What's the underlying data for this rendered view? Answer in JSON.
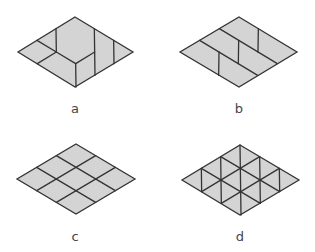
{
  "style": {
    "fill": "#d4d4d4",
    "stroke": "#333333",
    "background": "#ffffff"
  },
  "figures": [
    {
      "id": "a",
      "label": "a",
      "label_pos": [
        75,
        102
      ],
      "top": [
        75,
        17
      ],
      "right": [
        133,
        52
      ],
      "bottom": [
        75,
        87
      ],
      "left": [
        18,
        52
      ],
      "divisions": 3,
      "segments": [
        [
          [
            0,
            1
          ],
          [
            1,
            2
          ]
        ],
        [
          [
            0,
            2
          ],
          [
            1,
            2
          ]
        ],
        [
          [
            1,
            2
          ],
          [
            2,
            2
          ]
        ],
        [
          [
            1,
            2
          ],
          [
            1,
            3
          ]
        ],
        [
          [
            2,
            2
          ],
          [
            3,
            3
          ]
        ],
        [
          [
            2,
            2
          ],
          [
            2,
            1
          ]
        ],
        [
          [
            1,
            0
          ],
          [
            3,
            2
          ]
        ],
        [
          [
            2,
            0
          ],
          [
            3,
            1
          ]
        ]
      ]
    },
    {
      "id": "b",
      "label": "b",
      "label_pos": [
        239,
        102
      ],
      "top": [
        239,
        17
      ],
      "right": [
        297,
        52
      ],
      "bottom": [
        239,
        87
      ],
      "left": [
        180,
        52
      ],
      "divisions": 3,
      "segments": [
        [
          [
            0,
            1
          ],
          [
            3,
            1
          ]
        ],
        [
          [
            0,
            2
          ],
          [
            3,
            2
          ]
        ],
        [
          [
            1,
            0
          ],
          [
            2,
            1
          ]
        ],
        [
          [
            1,
            1
          ],
          [
            2,
            2
          ]
        ],
        [
          [
            1,
            2
          ],
          [
            2,
            3
          ]
        ]
      ]
    },
    {
      "id": "c",
      "label": "c",
      "label_pos": [
        75,
        230
      ],
      "top": [
        76,
        144
      ],
      "right": [
        135,
        179
      ],
      "bottom": [
        76,
        214
      ],
      "left": [
        17,
        179
      ],
      "divisions": 3,
      "segments": [
        [
          [
            0,
            1
          ],
          [
            3,
            1
          ]
        ],
        [
          [
            0,
            2
          ],
          [
            3,
            2
          ]
        ],
        [
          [
            1,
            0
          ],
          [
            1,
            3
          ]
        ],
        [
          [
            2,
            0
          ],
          [
            2,
            3
          ]
        ]
      ]
    },
    {
      "id": "d",
      "label": "d",
      "label_pos": [
        240,
        230
      ],
      "top": [
        240,
        145
      ],
      "right": [
        299,
        180
      ],
      "bottom": [
        240,
        215
      ],
      "left": [
        182,
        180
      ],
      "divisions": 3,
      "segments": [
        [
          [
            0,
            1
          ],
          [
            3,
            1
          ]
        ],
        [
          [
            0,
            2
          ],
          [
            3,
            2
          ]
        ],
        [
          [
            1,
            0
          ],
          [
            1,
            3
          ]
        ],
        [
          [
            2,
            0
          ],
          [
            2,
            3
          ]
        ],
        [
          [
            0,
            0
          ],
          [
            3,
            3
          ]
        ],
        [
          [
            0,
            1
          ],
          [
            2,
            3
          ]
        ],
        [
          [
            1,
            0
          ],
          [
            3,
            2
          ]
        ],
        [
          [
            0,
            2
          ],
          [
            1,
            3
          ]
        ],
        [
          [
            2,
            0
          ],
          [
            3,
            1
          ]
        ]
      ]
    }
  ]
}
